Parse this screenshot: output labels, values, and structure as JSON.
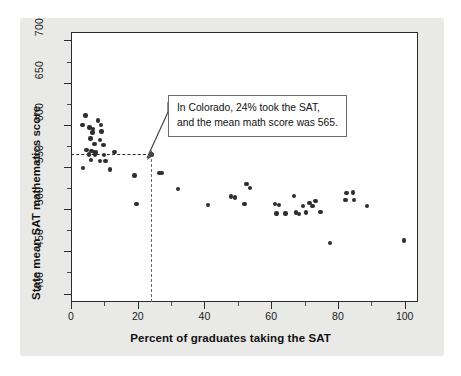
{
  "chart_data": {
    "type": "scatter",
    "title": "",
    "xlabel": "Percent of graduates taking the SAT",
    "ylabel": "State mean SAT mathematics score",
    "xlim": [
      0,
      104
    ],
    "ylim": [
      390,
      710
    ],
    "xticks": [
      0,
      20,
      40,
      60,
      80,
      100
    ],
    "yticks": [
      400,
      450,
      500,
      550,
      600,
      650,
      700
    ],
    "xtick_labels": [
      "0",
      "20",
      "40",
      "60",
      "80",
      "100"
    ],
    "ytick_labels": [
      "400",
      "450",
      "500",
      "550",
      "600",
      "650",
      "700"
    ],
    "xminor_ticks": [
      10,
      30,
      50,
      70,
      90
    ],
    "yminor_ticks": [
      425,
      475,
      525,
      575,
      625,
      675
    ],
    "grid": false,
    "legend": null,
    "marker_color": "#2e2e2e",
    "points": [
      {
        "x": 4.3,
        "y": 611
      },
      {
        "x": 3.4,
        "y": 600
      },
      {
        "x": 8.0,
        "y": 605
      },
      {
        "x": 8.9,
        "y": 600
      },
      {
        "x": 5.6,
        "y": 597
      },
      {
        "x": 6.6,
        "y": 595
      },
      {
        "x": 6.4,
        "y": 591
      },
      {
        "x": 9.1,
        "y": 592
      },
      {
        "x": 5.9,
        "y": 584
      },
      {
        "x": 8.7,
        "y": 582
      },
      {
        "x": 7.0,
        "y": 577
      },
      {
        "x": 9.7,
        "y": 576
      },
      {
        "x": 4.6,
        "y": 570
      },
      {
        "x": 6.1,
        "y": 569
      },
      {
        "x": 6.8,
        "y": 568
      },
      {
        "x": 7.4,
        "y": 567
      },
      {
        "x": 13.0,
        "y": 568
      },
      {
        "x": 5.4,
        "y": 565
      },
      {
        "x": 7.2,
        "y": 564
      },
      {
        "x": 9.8,
        "y": 564
      },
      {
        "x": 6.0,
        "y": 558
      },
      {
        "x": 8.6,
        "y": 557
      },
      {
        "x": 10.3,
        "y": 557
      },
      {
        "x": 3.6,
        "y": 549
      },
      {
        "x": 11.6,
        "y": 547
      },
      {
        "x": 19.0,
        "y": 540
      },
      {
        "x": 26.5,
        "y": 543
      },
      {
        "x": 27.3,
        "y": 543
      },
      {
        "x": 19.6,
        "y": 506
      },
      {
        "x": 32.0,
        "y": 524
      },
      {
        "x": 41.0,
        "y": 505
      },
      {
        "x": 48.0,
        "y": 515
      },
      {
        "x": 49.2,
        "y": 514
      },
      {
        "x": 52.0,
        "y": 506
      },
      {
        "x": 52.6,
        "y": 530
      },
      {
        "x": 53.6,
        "y": 525
      },
      {
        "x": 61.2,
        "y": 506
      },
      {
        "x": 62.3,
        "y": 505
      },
      {
        "x": 61.6,
        "y": 495
      },
      {
        "x": 64.3,
        "y": 495
      },
      {
        "x": 66.8,
        "y": 516
      },
      {
        "x": 67.5,
        "y": 496
      },
      {
        "x": 68.4,
        "y": 494
      },
      {
        "x": 69.5,
        "y": 504
      },
      {
        "x": 70.5,
        "y": 496
      },
      {
        "x": 71.5,
        "y": 507
      },
      {
        "x": 72.4,
        "y": 504
      },
      {
        "x": 73.3,
        "y": 510
      },
      {
        "x": 74.8,
        "y": 497
      },
      {
        "x": 77.6,
        "y": 460
      },
      {
        "x": 82.6,
        "y": 519
      },
      {
        "x": 82.3,
        "y": 511
      },
      {
        "x": 84.5,
        "y": 520
      },
      {
        "x": 84.8,
        "y": 511
      },
      {
        "x": 88.7,
        "y": 504
      },
      {
        "x": 99.8,
        "y": 463
      }
    ],
    "highlight_point": {
      "label": "Colorado",
      "x": 24,
      "y": 565
    },
    "reference_lines": {
      "horizontal_value": 565,
      "vertical_value": 24,
      "style": "dashed"
    },
    "annotation": {
      "line1": "In Colorado, 24% took the SAT,",
      "line2": "and the mean math score was 565."
    }
  }
}
